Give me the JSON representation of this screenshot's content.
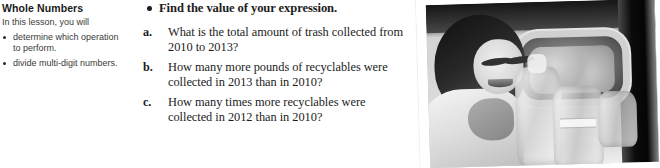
{
  "sidebar": {
    "title": "Whole Numbers",
    "intro": "In this lesson, you will",
    "items": [
      {
        "label": "determine which operation to perform."
      },
      {
        "label": "divide multi-digit numbers."
      }
    ]
  },
  "main": {
    "lead_bullet": "Find the value of your expression.",
    "questions": [
      {
        "marker": "a.",
        "text": "What is the total amount of trash collected from 2010 to 2013?"
      },
      {
        "marker": "b.",
        "text": "How many more pounds of recyclables were collected in 2013 than in 2010?"
      },
      {
        "marker": "c.",
        "text": "How many times more recyclables were collected in 2012 than in 2010?"
      }
    ]
  },
  "photo": {
    "alt": "Smiling young woman in a light coat placing plastic bottles into a recycling bin"
  }
}
